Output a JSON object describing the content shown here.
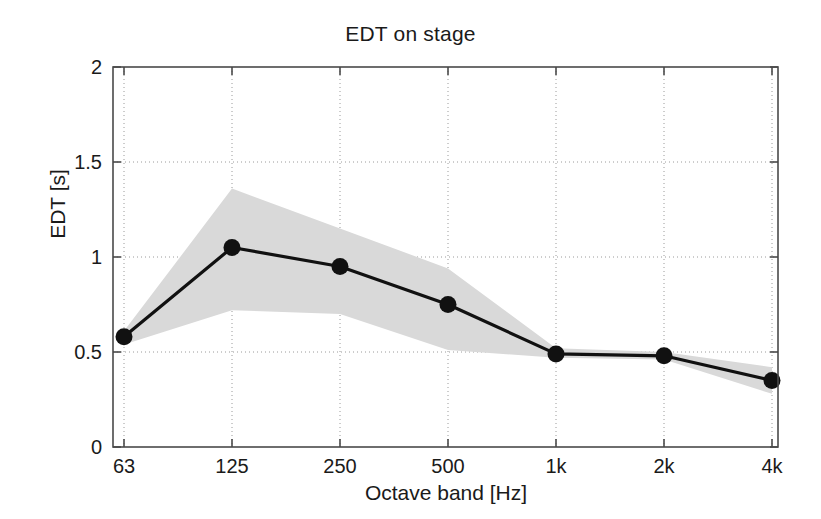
{
  "chart_data": {
    "type": "line",
    "title": "EDT on stage",
    "xlabel": "Octave band [Hz]",
    "ylabel": "EDT [s]",
    "categories": [
      "63",
      "125",
      "250",
      "500",
      "1k",
      "2k",
      "4k"
    ],
    "values": [
      0.58,
      1.05,
      0.95,
      0.75,
      0.49,
      0.48,
      0.35
    ],
    "series": [
      {
        "name": "EDT mean",
        "values": [
          0.58,
          1.05,
          0.95,
          0.75,
          0.49,
          0.48,
          0.35
        ]
      },
      {
        "name": "spread band upper",
        "values": [
          0.61,
          1.36,
          1.15,
          0.94,
          0.52,
          0.5,
          0.42
        ]
      },
      {
        "name": "spread band lower",
        "values": [
          0.54,
          0.72,
          0.7,
          0.51,
          0.47,
          0.46,
          0.28
        ]
      }
    ],
    "ylim": [
      0,
      2
    ],
    "yticks": [
      "0",
      "0.5",
      "1",
      "1.5",
      "2"
    ],
    "ytick_values": [
      0,
      0.5,
      1,
      1.5,
      2
    ],
    "xticks": [
      "63",
      "125",
      "250",
      "500",
      "1k",
      "2k",
      "4k"
    ],
    "grid": true,
    "grid_style": "dotted",
    "legend": "none",
    "marker": "filled-circle",
    "line_color": "#111111",
    "band_color": "#d9d9d9",
    "grid_color": "#9a9a9a",
    "axis_color": "#4a4a4a",
    "background": "#ffffff"
  }
}
